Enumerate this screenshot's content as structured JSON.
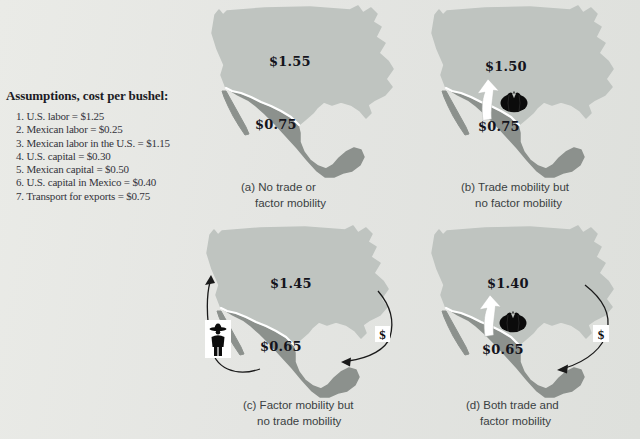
{
  "assumptions": {
    "title": "Assumptions, cost per bushel:",
    "items": [
      "1. U.S. labor = $1.25",
      "2. Mexican labor = $0.25",
      "3. Mexican labor in the U.S. = $1.15",
      "4. U.S. capital = $0.30",
      "5. Mexican capital = $0.50",
      "6. U.S. capital in Mexico = $0.40",
      "7. Transport for exports = $0.75"
    ]
  },
  "panels": {
    "a": {
      "us_price": "$1.55",
      "mexico_price": "$0.75",
      "caption_line1": "(a) No trade or",
      "caption_line2": "factor mobility"
    },
    "b": {
      "us_price": "$1.50",
      "mexico_price": "$0.75",
      "caption_line1": "(b) Trade mobility but",
      "caption_line2": "no factor mobility"
    },
    "c": {
      "us_price": "$1.45",
      "mexico_price": "$0.65",
      "caption_line1": "(c) Factor mobility but",
      "caption_line2": "no trade mobility"
    },
    "d": {
      "us_price": "$1.40",
      "mexico_price": "$0.65",
      "caption_line1": "(d) Both trade and",
      "caption_line2": "factor mobility"
    }
  },
  "icons": {
    "dollar_sign": "$",
    "tomato": "tomato-produce-icon",
    "worker": "migrant-worker-icon",
    "trade_arrow": "white-export-arrow"
  },
  "colors": {
    "background": "#e4e5e2",
    "us_fill": "#bfc4c0",
    "mexico_fill": "#8c918d",
    "border_line": "#ffffff",
    "text_dark": "#1e1e27",
    "icon_black": "#0d0d0d"
  }
}
